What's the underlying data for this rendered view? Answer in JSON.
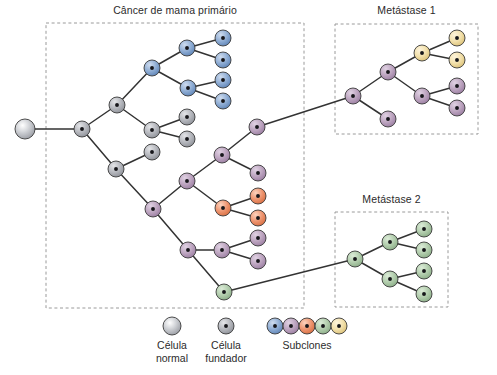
{
  "figure": {
    "title_primary": "Câncer de mama primário",
    "title_met1": "Metástase 1",
    "title_met2": "Metástase 2"
  },
  "legend": {
    "normal_label": "Célula\nnormal",
    "founder_label": "Célula\nfundador",
    "subclones_label": "Subclones",
    "normal_swatch": {
      "cx": 172,
      "cy": 326,
      "r": 9,
      "type": "normal",
      "color": "#b9bcc2"
    },
    "founder_swatch": {
      "cx": 226,
      "cy": 326,
      "r": 8,
      "type": "founder",
      "color": "#a8aab0"
    },
    "subclone_swatches": [
      {
        "cx": 275,
        "cy": 326,
        "r": 8,
        "color": "#7b9fcc"
      },
      {
        "cx": 291,
        "cy": 326,
        "r": 8,
        "color": "#b49ab8"
      },
      {
        "cx": 307,
        "cy": 326,
        "r": 8,
        "color": "#e8855a"
      },
      {
        "cx": 323,
        "cy": 326,
        "r": 8,
        "color": "#a8c6a4"
      },
      {
        "cx": 339,
        "cy": 326,
        "r": 8,
        "color": "#f0dca8"
      }
    ]
  },
  "colors": {
    "normal": "#b9bcc2",
    "founder": "#a8aab0",
    "blue": "#7b9fcc",
    "purple": "#b49ab8",
    "orange": "#e8855a",
    "green": "#a8c6a4",
    "tan": "#f0dca8",
    "stroke": "#3a3a3a",
    "edge": "#333333",
    "dash": "#9a9a9a",
    "text": "#2b2b2b"
  },
  "boxes": [
    {
      "name": "primary",
      "x": 46,
      "y": 23,
      "w": 258,
      "h": 285,
      "label": "Câncer de mama primário",
      "label_x": 175,
      "label_y": 11
    },
    {
      "name": "met1",
      "x": 335,
      "y": 24,
      "w": 143,
      "h": 110,
      "label": "Metástase 1",
      "label_x": 406,
      "label_y": 11
    },
    {
      "name": "met2",
      "x": 335,
      "y": 212,
      "w": 113,
      "h": 95,
      "label": "Metástase 2",
      "label_x": 391,
      "label_y": 200
    }
  ],
  "chart_data": {
    "type": "diagram",
    "nodes": [
      {
        "id": "normal",
        "cx": 25,
        "cy": 129,
        "r": 10,
        "kind": "normal"
      },
      {
        "id": "founder",
        "cx": 82,
        "cy": 129,
        "r": 8,
        "kind": "founder"
      },
      {
        "id": "g1",
        "cx": 117,
        "cy": 105,
        "r": 8,
        "kind": "founder"
      },
      {
        "id": "b1",
        "cx": 152,
        "cy": 68,
        "r": 8,
        "kind": "blue"
      },
      {
        "id": "b2",
        "cx": 187,
        "cy": 48,
        "r": 8,
        "kind": "blue"
      },
      {
        "id": "b3",
        "cx": 223,
        "cy": 38,
        "r": 8,
        "kind": "blue"
      },
      {
        "id": "b4",
        "cx": 223,
        "cy": 60,
        "r": 8,
        "kind": "blue"
      },
      {
        "id": "b5",
        "cx": 188,
        "cy": 88,
        "r": 8,
        "kind": "blue"
      },
      {
        "id": "b6",
        "cx": 223,
        "cy": 80,
        "r": 8,
        "kind": "blue"
      },
      {
        "id": "b7",
        "cx": 223,
        "cy": 101,
        "r": 8,
        "kind": "blue"
      },
      {
        "id": "g2",
        "cx": 152,
        "cy": 130,
        "r": 8,
        "kind": "founder"
      },
      {
        "id": "g3",
        "cx": 187,
        "cy": 117,
        "r": 8,
        "kind": "founder"
      },
      {
        "id": "g4",
        "cx": 187,
        "cy": 139,
        "r": 8,
        "kind": "founder"
      },
      {
        "id": "g5",
        "cx": 116,
        "cy": 169,
        "r": 8,
        "kind": "founder"
      },
      {
        "id": "g6",
        "cx": 152,
        "cy": 152,
        "r": 8,
        "kind": "founder"
      },
      {
        "id": "p1",
        "cx": 153,
        "cy": 209,
        "r": 8,
        "kind": "purple"
      },
      {
        "id": "p2",
        "cx": 187,
        "cy": 181,
        "r": 8,
        "kind": "purple"
      },
      {
        "id": "p3",
        "cx": 222,
        "cy": 155,
        "r": 8,
        "kind": "purple"
      },
      {
        "id": "p4",
        "cx": 257,
        "cy": 127,
        "r": 8,
        "kind": "purple"
      },
      {
        "id": "p5",
        "cx": 258,
        "cy": 173,
        "r": 8,
        "kind": "purple"
      },
      {
        "id": "o1",
        "cx": 223,
        "cy": 208,
        "r": 8,
        "kind": "orange"
      },
      {
        "id": "o2",
        "cx": 258,
        "cy": 196,
        "r": 8,
        "kind": "orange"
      },
      {
        "id": "o3",
        "cx": 258,
        "cy": 218,
        "r": 8,
        "kind": "orange"
      },
      {
        "id": "p6",
        "cx": 188,
        "cy": 250,
        "r": 8,
        "kind": "purple"
      },
      {
        "id": "p7",
        "cx": 222,
        "cy": 250,
        "r": 8,
        "kind": "purple"
      },
      {
        "id": "p8",
        "cx": 258,
        "cy": 238,
        "r": 8,
        "kind": "purple"
      },
      {
        "id": "p9",
        "cx": 258,
        "cy": 261,
        "r": 8,
        "kind": "purple"
      },
      {
        "id": "gr0",
        "cx": 224,
        "cy": 292,
        "r": 8,
        "kind": "green"
      },
      {
        "id": "m1a",
        "cx": 353,
        "cy": 96,
        "r": 8,
        "kind": "purple"
      },
      {
        "id": "m1b",
        "cx": 388,
        "cy": 72,
        "r": 8,
        "kind": "purple"
      },
      {
        "id": "m1c",
        "cx": 388,
        "cy": 119,
        "r": 8,
        "kind": "purple"
      },
      {
        "id": "m1d",
        "cx": 422,
        "cy": 53,
        "r": 8,
        "kind": "tan"
      },
      {
        "id": "m1e",
        "cx": 457,
        "cy": 38,
        "r": 8,
        "kind": "tan"
      },
      {
        "id": "m1f",
        "cx": 457,
        "cy": 60,
        "r": 8,
        "kind": "tan"
      },
      {
        "id": "m1g",
        "cx": 422,
        "cy": 96,
        "r": 8,
        "kind": "purple"
      },
      {
        "id": "m1h",
        "cx": 457,
        "cy": 86,
        "r": 8,
        "kind": "purple"
      },
      {
        "id": "m1i",
        "cx": 457,
        "cy": 108,
        "r": 8,
        "kind": "purple"
      },
      {
        "id": "m2a",
        "cx": 355,
        "cy": 259,
        "r": 8,
        "kind": "green"
      },
      {
        "id": "m2b",
        "cx": 390,
        "cy": 242,
        "r": 8,
        "kind": "green"
      },
      {
        "id": "m2c",
        "cx": 390,
        "cy": 279,
        "r": 8,
        "kind": "green"
      },
      {
        "id": "m2d",
        "cx": 424,
        "cy": 229,
        "r": 8,
        "kind": "green"
      },
      {
        "id": "m2e",
        "cx": 424,
        "cy": 250,
        "r": 8,
        "kind": "green"
      },
      {
        "id": "m2f",
        "cx": 424,
        "cy": 271,
        "r": 8,
        "kind": "green"
      },
      {
        "id": "m2g",
        "cx": 424,
        "cy": 294,
        "r": 8,
        "kind": "green"
      }
    ],
    "edges": [
      [
        "normal",
        "founder"
      ],
      [
        "founder",
        "g1"
      ],
      [
        "founder",
        "g5"
      ],
      [
        "g1",
        "b1"
      ],
      [
        "g1",
        "g2"
      ],
      [
        "b1",
        "b2"
      ],
      [
        "b1",
        "b5"
      ],
      [
        "b2",
        "b3"
      ],
      [
        "b2",
        "b4"
      ],
      [
        "b5",
        "b6"
      ],
      [
        "b5",
        "b7"
      ],
      [
        "g2",
        "g3"
      ],
      [
        "g2",
        "g4"
      ],
      [
        "g5",
        "g6"
      ],
      [
        "g5",
        "p1"
      ],
      [
        "p1",
        "p2"
      ],
      [
        "p1",
        "p6"
      ],
      [
        "p2",
        "p3"
      ],
      [
        "p2",
        "o1"
      ],
      [
        "p3",
        "p4"
      ],
      [
        "p3",
        "p5"
      ],
      [
        "o1",
        "o2"
      ],
      [
        "o1",
        "o3"
      ],
      [
        "p6",
        "p7"
      ],
      [
        "p6",
        "gr0"
      ],
      [
        "p7",
        "p8"
      ],
      [
        "p7",
        "p9"
      ],
      [
        "p4",
        "m1a"
      ],
      [
        "gr0",
        "m2a"
      ],
      [
        "m1a",
        "m1b"
      ],
      [
        "m1a",
        "m1c"
      ],
      [
        "m1b",
        "m1d"
      ],
      [
        "m1b",
        "m1g"
      ],
      [
        "m1d",
        "m1e"
      ],
      [
        "m1d",
        "m1f"
      ],
      [
        "m1g",
        "m1h"
      ],
      [
        "m1g",
        "m1i"
      ],
      [
        "m2a",
        "m2b"
      ],
      [
        "m2a",
        "m2c"
      ],
      [
        "m2b",
        "m2d"
      ],
      [
        "m2b",
        "m2e"
      ],
      [
        "m2c",
        "m2f"
      ],
      [
        "m2c",
        "m2g"
      ]
    ]
  }
}
